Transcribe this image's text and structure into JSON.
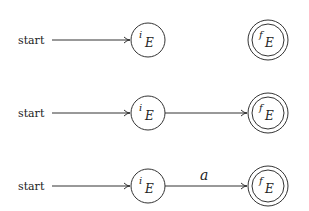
{
  "diagram": {
    "type": "finite-automaton-construction",
    "colors": {
      "stroke": "#333333",
      "text": "#222222",
      "background": "#ffffff"
    },
    "rows": [
      {
        "start_label": "start",
        "initial_state": {
          "base": "i",
          "sub": "E"
        },
        "final_state": {
          "base": "f",
          "sub": "E"
        },
        "transition": null
      },
      {
        "start_label": "start",
        "initial_state": {
          "base": "i",
          "sub": "E"
        },
        "final_state": {
          "base": "f",
          "sub": "E"
        },
        "transition": {
          "label": ""
        }
      },
      {
        "start_label": "start",
        "initial_state": {
          "base": "i",
          "sub": "E"
        },
        "final_state": {
          "base": "f",
          "sub": "E"
        },
        "transition": {
          "label": "a"
        }
      }
    ]
  }
}
